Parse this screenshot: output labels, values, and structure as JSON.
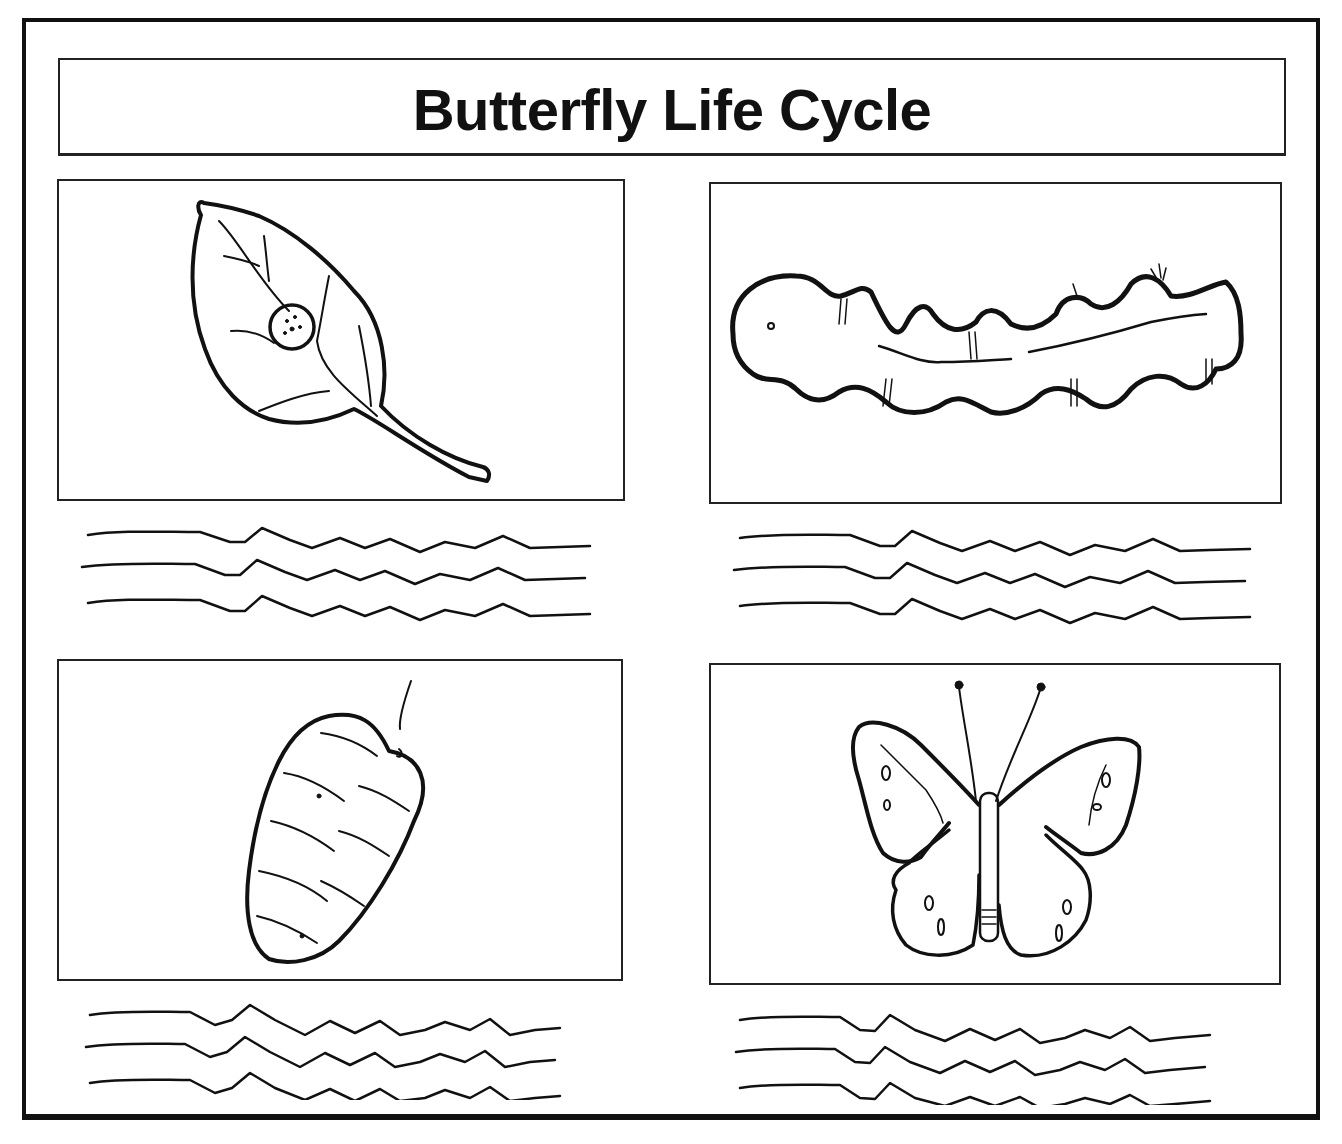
{
  "worksheet": {
    "title": "Butterfly Life Cycle",
    "stages": [
      {
        "name": "Egg on leaf",
        "icon": "egg-on-leaf-icon",
        "position": "top-left",
        "answer_lines": 3
      },
      {
        "name": "Caterpillar",
        "icon": "caterpillar-icon",
        "position": "top-right",
        "answer_lines": 3
      },
      {
        "name": "Chrysalis",
        "icon": "chrysalis-icon",
        "position": "bottom-left",
        "answer_lines": 3
      },
      {
        "name": "Butterfly",
        "icon": "butterfly-icon",
        "position": "bottom-right",
        "answer_lines": 3
      }
    ]
  },
  "colors": {
    "ink": "#111111",
    "paper": "#ffffff"
  }
}
